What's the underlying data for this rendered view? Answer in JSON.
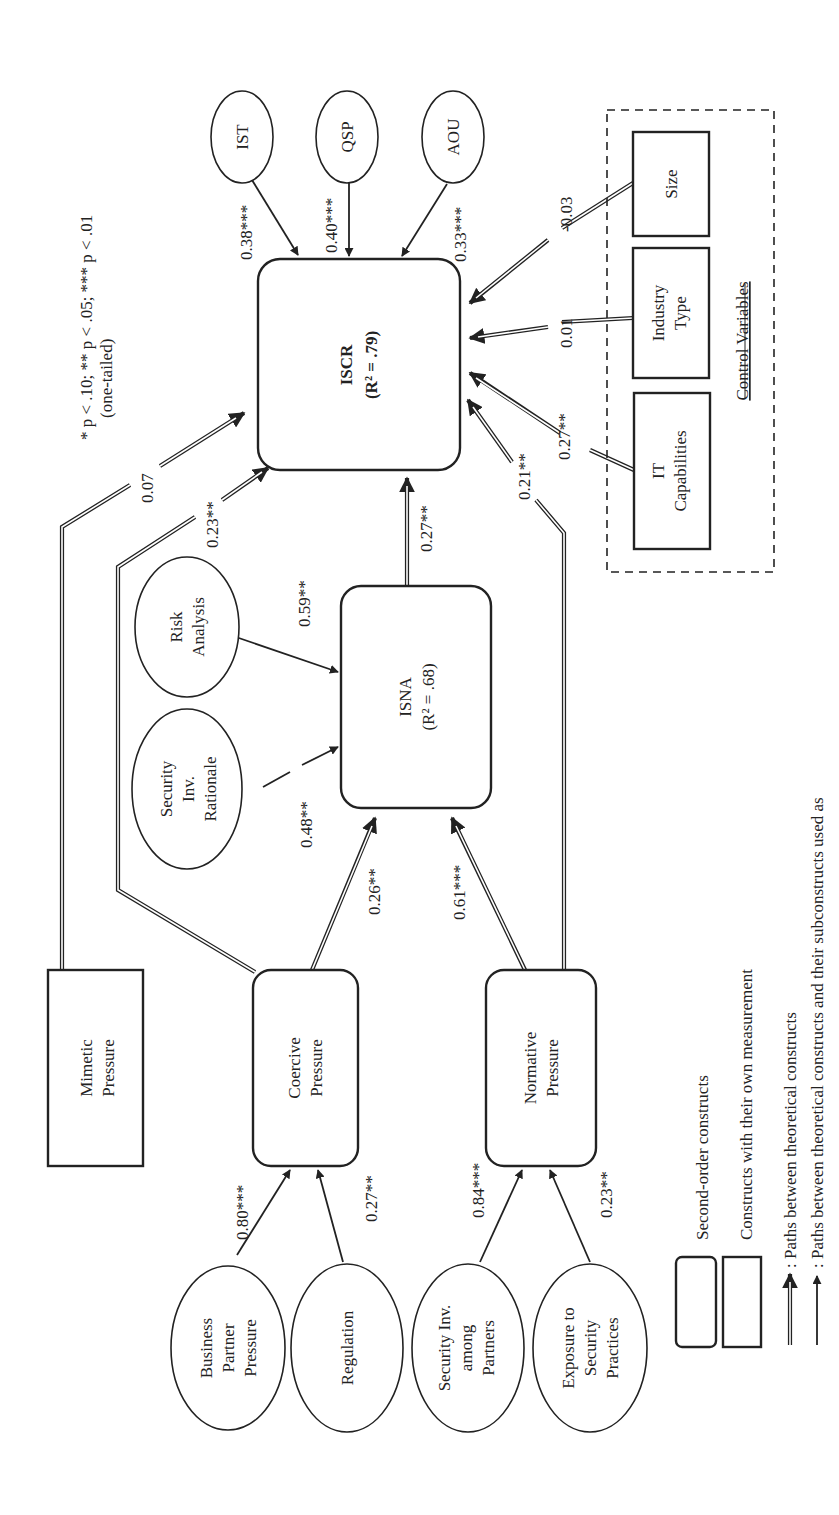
{
  "figure": {
    "orientation": "rotated 90 degrees counter-clockwise",
    "significance_note": {
      "line1": "* p < .10; ** p < .05; *** p < .01",
      "line2": "(one-tailed)"
    }
  },
  "nodes": {
    "iscr": {
      "name": "ISCR",
      "r2": "(R² = .79)",
      "type": "second-order"
    },
    "isna": {
      "name": "ISNA",
      "r2": "(R² = .68)",
      "type": "second-order"
    },
    "mimetic": {
      "line1": "Mimetic",
      "line2": "Pressure",
      "type": "own-measurement"
    },
    "coercive": {
      "line1": "Coercive",
      "line2": "Pressure",
      "type": "second-order"
    },
    "normative": {
      "line1": "Normative",
      "line2": "Pressure",
      "type": "second-order"
    },
    "ist": {
      "label": "IST"
    },
    "qsp": {
      "label": "QSP"
    },
    "aou": {
      "label": "AOU"
    },
    "risk_analysis": {
      "line1": "Risk",
      "line2": "Analysis"
    },
    "sec_inv_rationale": {
      "line1": "Security",
      "line2": "Inv.",
      "line3": "Rationale"
    },
    "business_partner": {
      "line1": "Business",
      "line2": "Partner",
      "line3": "Pressure"
    },
    "regulation": {
      "label": "Regulation"
    },
    "sec_inv_partners": {
      "line1": "Security Inv.",
      "line2": "among",
      "line3": "Partners"
    },
    "exposure": {
      "line1": "Exposure to",
      "line2": "Security",
      "line3": "Practices"
    },
    "size": {
      "label": "Size"
    },
    "industry_type": {
      "line1": "Industry",
      "line2": "Type"
    },
    "it_capabilities": {
      "line1": "IT",
      "line2": "Capabilities"
    },
    "control_variables": {
      "label": "Control Variables"
    }
  },
  "paths": {
    "ist_iscr": "0.38***",
    "qsp_iscr": "0.40***",
    "aou_iscr": "0.33***",
    "mimetic_iscr": "0.07",
    "coercive_iscr": "0.23**",
    "isna_iscr": "0.27**",
    "normative_iscr": "0.21**",
    "size_iscr": "-0.03",
    "industry_iscr": "0.01",
    "itcap_iscr": "0.27**",
    "risk_isna": "0.59**",
    "rationale_isna": "0.48**",
    "coercive_isna": "0.26**",
    "normative_isna": "0.61***",
    "bpp_coercive": "0.80***",
    "regulation_coercive": "0.27**",
    "partners_normative": "0.84***",
    "exposure_normative": "0.23**"
  },
  "legend": {
    "rounded_box": "Second-order constructs",
    "square_box": "Constructs with their own measurement",
    "double_arrow": ": Paths between theoretical constructs",
    "single_arrow": ": Paths between theoretical constructs and their subconstructs used as"
  }
}
